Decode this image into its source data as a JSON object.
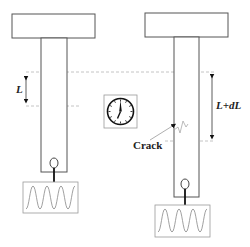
{
  "diagram": {
    "colors": {
      "line": "#555555",
      "dashed": "#aaaaaa",
      "arrow": "#111111",
      "wave": "#888888",
      "background": "#ffffff"
    },
    "left_specimen": {
      "state": "before",
      "gauge_label": "L",
      "signal": "sinusoidal-waveform"
    },
    "center": {
      "icon": "clock-icon",
      "meaning": "time elapsed"
    },
    "right_specimen": {
      "state": "after",
      "gauge_label": "L+dL",
      "crack_label": "Crack",
      "signal": "sinusoidal-waveform"
    }
  }
}
